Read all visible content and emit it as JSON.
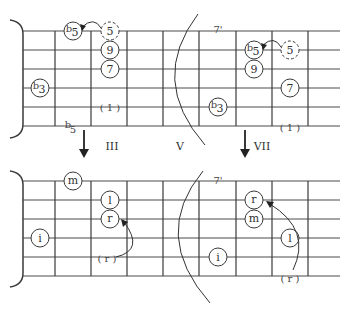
{
  "diagram": {
    "top_left": {
      "notes": [
        {
          "label": "b5",
          "sup": "b",
          "main": "5",
          "x": 73,
          "y": 31,
          "dashed": false
        },
        {
          "label": "5",
          "sup": "",
          "main": "5",
          "x": 110,
          "y": 31,
          "dashed": true
        },
        {
          "label": "9",
          "sup": "",
          "main": "9",
          "x": 110,
          "y": 50,
          "dashed": false
        },
        {
          "label": "7",
          "sup": "",
          "main": "7",
          "x": 110,
          "y": 69,
          "dashed": false
        },
        {
          "label": "b3",
          "sup": "b",
          "main": "3",
          "x": 40,
          "y": 88,
          "dashed": false
        }
      ],
      "root_mark": "( 1 )",
      "below_label": "b5",
      "below_label_sup": "b",
      "below_label_main": "5"
    },
    "top_right": {
      "fret_label": "7'",
      "notes": [
        {
          "label": "b5",
          "sup": "b",
          "main": "5",
          "x": 254,
          "y": 50,
          "dashed": false
        },
        {
          "label": "5",
          "sup": "",
          "main": "5",
          "x": 290,
          "y": 50,
          "dashed": true
        },
        {
          "label": "9",
          "sup": "",
          "main": "9",
          "x": 254,
          "y": 69,
          "dashed": false
        },
        {
          "label": "7",
          "sup": "",
          "main": "7",
          "x": 290,
          "y": 88,
          "dashed": false
        },
        {
          "label": "b3",
          "sup": "b",
          "main": "3",
          "x": 218,
          "y": 107,
          "dashed": false
        }
      ],
      "root_mark": "( 1 )"
    },
    "position_labels": {
      "left": "III",
      "middle": "V",
      "right": "VII"
    },
    "bottom_left": {
      "fingers": [
        {
          "label": "m",
          "x": 73,
          "y": 181
        },
        {
          "label": "l",
          "x": 110,
          "y": 200
        },
        {
          "label": "r",
          "x": 110,
          "y": 219
        },
        {
          "label": "i",
          "x": 40,
          "y": 238
        }
      ],
      "slide_from": "( r )"
    },
    "bottom_right": {
      "fret_label": "7'",
      "fingers": [
        {
          "label": "r",
          "x": 254,
          "y": 200
        },
        {
          "label": "m",
          "x": 254,
          "y": 219
        },
        {
          "label": "l",
          "x": 290,
          "y": 238
        },
        {
          "label": "i",
          "x": 218,
          "y": 257
        }
      ],
      "slide_from": "( r )"
    }
  }
}
